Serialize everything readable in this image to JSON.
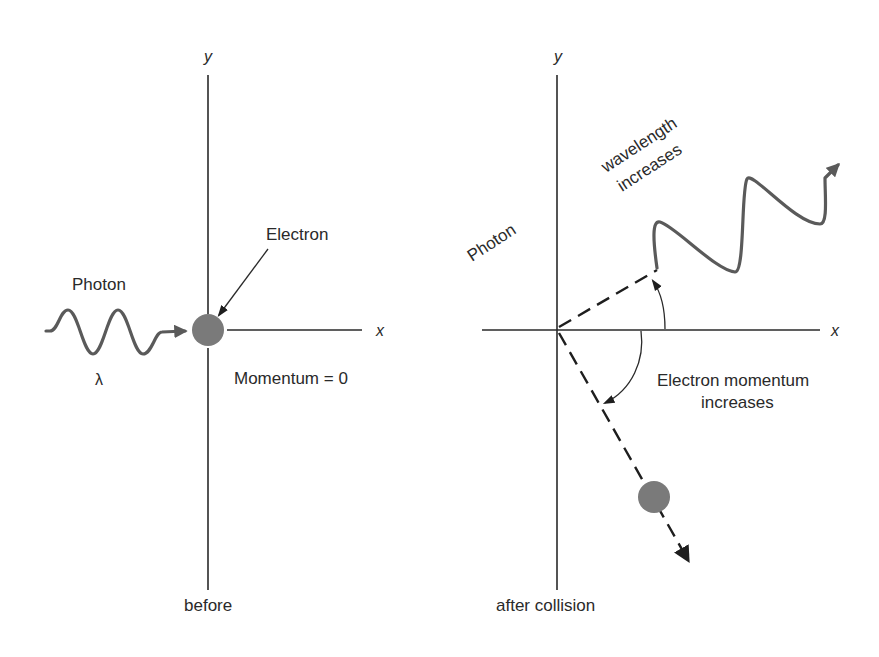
{
  "figure": {
    "colors": {
      "axis": "#2a2a2a",
      "wave": "#5a5a5a",
      "electron": "#7a7a7a",
      "text": "#2a2a2a",
      "background": "#ffffff"
    }
  },
  "before": {
    "caption": "before",
    "axis_x_label": "x",
    "axis_y_label": "y",
    "photon_label": "Photon",
    "wavelength_symbol": "λ",
    "electron_label": "Electron",
    "momentum_label": "Momentum = 0"
  },
  "after": {
    "caption": "after collision",
    "axis_x_label": "x",
    "axis_y_label": "y",
    "photon_label": "Photon",
    "wavelength_label_line1": "wavelength",
    "wavelength_label_line2": "increases",
    "electron_momentum_line1": "Electron momentum",
    "electron_momentum_line2": "increases"
  }
}
